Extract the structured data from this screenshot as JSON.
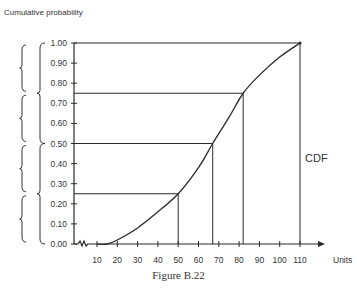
{
  "chart_data": {
    "type": "line",
    "title": "",
    "caption": "Figure B.22",
    "xlabel": "Units",
    "ylabel": "Cumulative probability",
    "curve_label": "CDF",
    "xlim": [
      10,
      110
    ],
    "ylim": [
      0.0,
      1.0
    ],
    "x_ticks": [
      10,
      20,
      30,
      40,
      50,
      60,
      70,
      80,
      90,
      100,
      110
    ],
    "y_ticks": [
      "0.00",
      "0.10",
      "0.20",
      "0.30",
      "0.40",
      "0.50",
      "0.60",
      "0.70",
      "0.80",
      "0.90",
      "1.00"
    ],
    "grid": false,
    "axis_break": "x axis near origin (zigzag)",
    "series": [
      {
        "name": "CDF",
        "x": [
          10,
          15,
          20,
          30,
          40,
          50,
          60,
          67,
          75,
          82,
          90,
          100,
          110
        ],
        "y": [
          0.0,
          0.0,
          0.02,
          0.08,
          0.16,
          0.25,
          0.38,
          0.5,
          0.63,
          0.75,
          0.84,
          0.93,
          1.0
        ]
      }
    ],
    "quartile_markers": [
      {
        "p": 0.25,
        "x": 50
      },
      {
        "p": 0.5,
        "x": 67
      },
      {
        "p": 0.75,
        "x": 82
      },
      {
        "p": 1.0,
        "x": 110
      }
    ],
    "left_braces": {
      "outer": [
        [
          0.75,
          1.0
        ],
        [
          0.5,
          0.75
        ],
        [
          0.25,
          0.5
        ],
        [
          0.0,
          0.25
        ]
      ],
      "inner": [
        [
          0.5,
          1.0
        ],
        [
          0.0,
          0.5
        ]
      ]
    }
  }
}
